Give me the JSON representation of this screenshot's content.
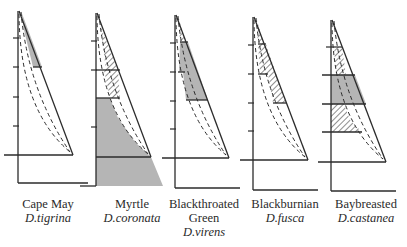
{
  "figure": {
    "colors": {
      "line": "#2b2b2b",
      "shade": "#b5b5b5",
      "hatch": "#444444",
      "background": "#ffffff"
    }
  },
  "species": [
    {
      "common": "Cape May",
      "common2": "",
      "scientific": "D.tigrina"
    },
    {
      "common": "Myrtle",
      "common2": "",
      "scientific": "D.coronata"
    },
    {
      "common": "Blackthroated",
      "common2": "Green",
      "scientific": "D.virens"
    },
    {
      "common": "Blackburnian",
      "common2": "",
      "scientific": "D.fusca"
    },
    {
      "common": "Baybreasted",
      "common2": "",
      "scientific": "D.castanea"
    }
  ]
}
